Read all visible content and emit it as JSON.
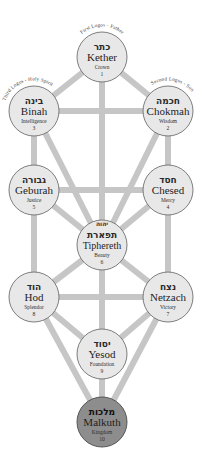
{
  "diagram": {
    "colors": {
      "path": "#c6c6c6",
      "node_fill": "#e8e8e8",
      "node_stroke": "#6f6f6f",
      "malkuth_fill": "#8d8d8d",
      "background": "#ffffff"
    }
  },
  "sephiroth": [
    {
      "id": "kether",
      "hebrew": "כתר",
      "name": "Kether",
      "title": "Crown",
      "number": "1",
      "arc_label": "First Logos - Father",
      "cx": 102,
      "cy": 57,
      "r": 25,
      "dark": false
    },
    {
      "id": "binah",
      "hebrew": "בינה",
      "name": "Binah",
      "title": "Intelligence",
      "number": "3",
      "arc_label": "Third Logos - Holy Spirit",
      "cx": 34,
      "cy": 111,
      "r": 25,
      "dark": false
    },
    {
      "id": "chokmah",
      "hebrew": "חכמה",
      "name": "Chokmah",
      "title": "Wisdom",
      "number": "2",
      "arc_label": "Second Logos - Son",
      "cx": 168,
      "cy": 111,
      "r": 25,
      "dark": false
    },
    {
      "id": "geburah",
      "hebrew": "גבורה",
      "name": "Geburah",
      "title": "Justice",
      "number": "5",
      "arc_label": "",
      "cx": 34,
      "cy": 190,
      "r": 25,
      "dark": false
    },
    {
      "id": "chesed",
      "hebrew": "חסד",
      "name": "Chesed",
      "title": "Mercy",
      "number": "4",
      "arc_label": "",
      "cx": 168,
      "cy": 190,
      "r": 25,
      "dark": false
    },
    {
      "id": "tiphereth",
      "hebrew": "תפארת",
      "name": "Tiphereth",
      "title": "Beauty",
      "number": "6",
      "arc_label": "",
      "cx": 102,
      "cy": 245,
      "r": 25,
      "dark": false
    },
    {
      "id": "hod",
      "hebrew": "הוד",
      "name": "Hod",
      "title": "Splendor",
      "number": "8",
      "arc_label": "",
      "cx": 34,
      "cy": 297,
      "r": 25,
      "dark": false
    },
    {
      "id": "netzach",
      "hebrew": "נצח",
      "name": "Netzach",
      "title": "Victory",
      "number": "7",
      "arc_label": "",
      "cx": 168,
      "cy": 297,
      "r": 25,
      "dark": false
    },
    {
      "id": "yesod",
      "hebrew": "יסוד",
      "name": "Yesod",
      "title": "Foundation",
      "number": "9",
      "arc_label": "",
      "cx": 102,
      "cy": 354,
      "r": 25,
      "dark": false
    },
    {
      "id": "malkuth",
      "hebrew": "מלכות",
      "name": "Malkuth",
      "title": "Kingdom",
      "number": "10",
      "arc_label": "",
      "cx": 102,
      "cy": 422,
      "r": 25,
      "dark": true
    }
  ],
  "tiphereth_upper_hebrew": "יהוה",
  "paths": [
    {
      "from": "kether",
      "to": "binah"
    },
    {
      "from": "kether",
      "to": "chokmah"
    },
    {
      "from": "kether",
      "to": "tiphereth"
    },
    {
      "from": "binah",
      "to": "chokmah"
    },
    {
      "from": "binah",
      "to": "geburah"
    },
    {
      "from": "binah",
      "to": "tiphereth"
    },
    {
      "from": "chokmah",
      "to": "chesed"
    },
    {
      "from": "chokmah",
      "to": "tiphereth"
    },
    {
      "from": "geburah",
      "to": "chesed"
    },
    {
      "from": "geburah",
      "to": "tiphereth"
    },
    {
      "from": "geburah",
      "to": "hod"
    },
    {
      "from": "chesed",
      "to": "tiphereth"
    },
    {
      "from": "chesed",
      "to": "netzach"
    },
    {
      "from": "tiphereth",
      "to": "hod"
    },
    {
      "from": "tiphereth",
      "to": "netzach"
    },
    {
      "from": "tiphereth",
      "to": "yesod"
    },
    {
      "from": "hod",
      "to": "netzach"
    },
    {
      "from": "hod",
      "to": "yesod"
    },
    {
      "from": "hod",
      "to": "malkuth"
    },
    {
      "from": "netzach",
      "to": "yesod"
    },
    {
      "from": "netzach",
      "to": "malkuth"
    },
    {
      "from": "yesod",
      "to": "malkuth"
    }
  ]
}
